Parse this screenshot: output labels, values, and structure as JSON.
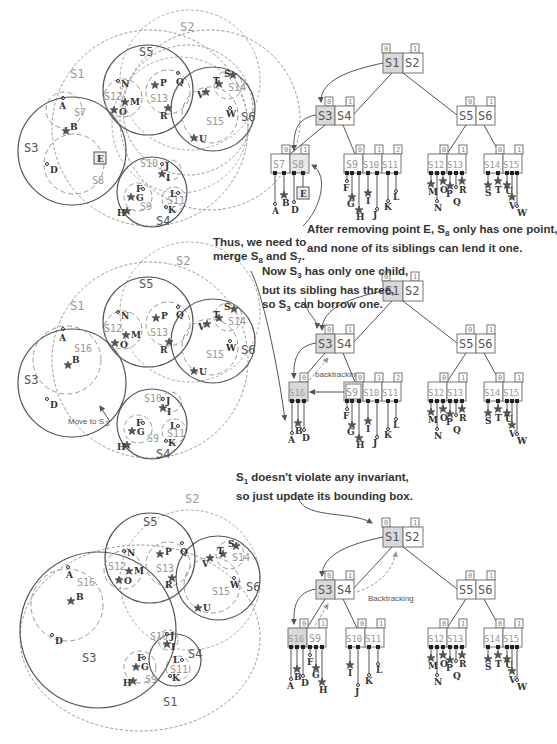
{
  "panels": [
    {
      "id": "panel-1",
      "regions": [
        "S1",
        "S2",
        "S3",
        "S4",
        "S5",
        "S6",
        "S7",
        "S8",
        "S9",
        "S10",
        "S11",
        "S12",
        "S13",
        "S14",
        "S15"
      ],
      "tree": {
        "root": {
          "children": [
            "S1",
            "S2"
          ],
          "indices": [
            "0",
            "1"
          ]
        },
        "level2": [
          {
            "children": [
              "S3",
              "S4"
            ],
            "indices": [
              "0",
              "1"
            ]
          },
          {
            "children": [
              "S5",
              "S6"
            ],
            "indices": [
              "0",
              "1"
            ]
          }
        ],
        "leaves": [
          {
            "children": [
              "S7",
              "S8"
            ],
            "indices": [
              "0",
              "1"
            ],
            "points": [
              "A",
              "B",
              "D",
              "E"
            ]
          },
          {
            "children": [
              "S9",
              "S10",
              "S11"
            ],
            "indices": [
              "0",
              "1",
              "2"
            ],
            "points": [
              "F",
              "G",
              "H",
              "I",
              "J",
              "K",
              "L"
            ]
          },
          {
            "children": [
              "S12",
              "S13"
            ],
            "indices": [
              "0",
              "1"
            ],
            "points": [
              "M",
              "N",
              "O",
              "P",
              "Q",
              "R"
            ]
          },
          {
            "children": [
              "S14",
              "S15"
            ],
            "indices": [
              "0",
              "1"
            ],
            "points": [
              "S",
              "T",
              "U",
              "V",
              "W"
            ]
          }
        ]
      },
      "note": "After removing point E, S8 only has one point, and none of its siblings can lend it one."
    },
    {
      "id": "panel-2",
      "note_left": "Thus, we need to merge S8 and S7.",
      "note_right": "Now S3 has only one child, but its sibling has three, so S3 can borrow one.",
      "map_annotation": "Move to S3",
      "tree_annotation": "backtracking",
      "tree": {
        "leaves": [
          {
            "children": [
              "S16"
            ],
            "indices": [
              "0"
            ],
            "points": [
              "A",
              "B",
              "D"
            ]
          },
          {
            "children": [
              "S9",
              "S10",
              "S11"
            ],
            "indices": [
              "0",
              "1",
              "2"
            ],
            "points": [
              "F",
              "G",
              "H",
              "I",
              "J",
              "K",
              "L"
            ]
          },
          {
            "children": [
              "S12",
              "S13"
            ],
            "indices": [
              "0",
              "1"
            ],
            "points": [
              "M",
              "N",
              "O",
              "P",
              "Q",
              "R"
            ]
          },
          {
            "children": [
              "S14",
              "S15"
            ],
            "indices": [
              "0",
              "1"
            ],
            "points": [
              "S",
              "T",
              "U",
              "V",
              "W"
            ]
          }
        ]
      }
    },
    {
      "id": "panel-3",
      "note": "S1 doesn't violate any invariant, so just update its bounding box.",
      "tree_annotation": "Backtracking",
      "tree": {
        "leaves": [
          {
            "children": [
              "S16",
              "S9"
            ],
            "indices": [
              "0",
              "1"
            ],
            "points": [
              "A",
              "B",
              "D",
              "F",
              "G",
              "H"
            ]
          },
          {
            "children": [
              "S10",
              "S11"
            ],
            "indices": [
              "0",
              "1"
            ],
            "points": [
              "I",
              "J",
              "K",
              "L"
            ]
          },
          {
            "children": [
              "S12",
              "S13"
            ],
            "indices": [
              "0",
              "1"
            ],
            "points": [
              "M",
              "N",
              "O",
              "P",
              "Q",
              "R"
            ]
          },
          {
            "children": [
              "S14",
              "S15"
            ],
            "indices": [
              "0",
              "1"
            ],
            "points": [
              "S",
              "T",
              "U",
              "V",
              "W"
            ]
          }
        ]
      }
    }
  ],
  "notes": {
    "n1_line1": "After removing point E, S",
    "n1_sub": "8",
    "n1_line1b": " only has one point,",
    "n1_line2": "and none of its siblings can lend it one.",
    "n2_line1": "Thus, we need to",
    "n2_line2a": "merge S",
    "n2_sub1": "8",
    "n2_line2b": " and S",
    "n2_sub2": "7",
    "n2_line2c": ".",
    "n3_line1a": "Now S",
    "n3_sub1": "3",
    "n3_line1b": " has only one child,",
    "n3_line2": "but its sibling has three,",
    "n3_line3a": "so S",
    "n3_sub2": "3",
    "n3_line3b": " can borrow one.",
    "n4_line1a": "S",
    "n4_sub": "1",
    "n4_line1b": " doesn't violate any invariant,",
    "n4_line2": "so just update its bounding box."
  },
  "labels": {
    "move_to_s3": "Move to S",
    "move_sub": "3",
    "backtracking_lower": "backtracking",
    "backtracking_upper": "Backtracking"
  },
  "colors": {
    "highlight_node": "#d9d9d9",
    "line": "#555555",
    "dashed": "#999999",
    "text": "#333333"
  }
}
